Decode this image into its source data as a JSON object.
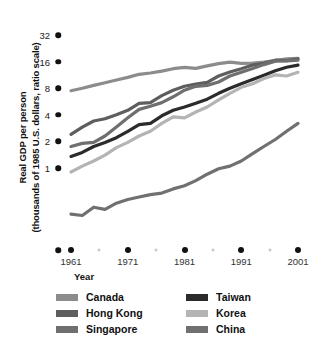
{
  "axes": {
    "ylabel_line1": "Real GDP per person",
    "ylabel_line2": "(thousands of 1985 U.S. dollars, ratio scale)",
    "xlabel": "Year",
    "ytick_labels": [
      "32",
      "16",
      "8",
      "4",
      "2",
      "1"
    ],
    "xtick_labels": [
      "1961",
      "1971",
      "1981",
      "1991",
      "2001"
    ]
  },
  "legend": {
    "left": [
      {
        "label": "Canada",
        "color": "#8c8c8c"
      },
      {
        "label": "Hong Kong",
        "color": "#5e5e5e"
      },
      {
        "label": "Singapore",
        "color": "#6f6f6f"
      }
    ],
    "right": [
      {
        "label": "Taiwan",
        "color": "#2b2b2b"
      },
      {
        "label": "Korea",
        "color": "#b4b4b4"
      },
      {
        "label": "China",
        "color": "#707070"
      }
    ]
  },
  "chart_data": {
    "type": "line",
    "title": "",
    "xlabel": "Year",
    "ylabel": "Real GDP per person (thousands of 1985 U.S. dollars, ratio scale)",
    "yscale": "log2",
    "ylim": [
      0.25,
      38
    ],
    "yticks": [
      1,
      2,
      4,
      8,
      16,
      32
    ],
    "xlim": [
      1960,
      2001
    ],
    "xticks": [
      1961,
      1971,
      1981,
      1991,
      2001
    ],
    "xminorticks": [
      1966,
      1976,
      1986,
      1996
    ],
    "grid": false,
    "legend_position": "below",
    "series": [
      {
        "name": "Canada",
        "color": "#8c8c8c",
        "x": [
          1961,
          1963,
          1965,
          1967,
          1969,
          1971,
          1973,
          1975,
          1977,
          1979,
          1981,
          1983,
          1985,
          1987,
          1989,
          1991,
          1993,
          1995,
          1997,
          1999,
          2001
        ],
        "values": [
          7.5,
          8.0,
          8.6,
          9.2,
          9.9,
          10.6,
          11.5,
          11.9,
          12.5,
          13.3,
          13.8,
          13.4,
          14.3,
          15.2,
          15.8,
          15.3,
          15.4,
          15.8,
          16.4,
          17.2,
          17.4
        ]
      },
      {
        "name": "Hong Kong",
        "color": "#5e5e5e",
        "x": [
          1961,
          1963,
          1965,
          1967,
          1969,
          1971,
          1973,
          1975,
          1977,
          1979,
          1981,
          1983,
          1985,
          1987,
          1989,
          1991,
          1993,
          1995,
          1997,
          1999,
          2001
        ],
        "values": [
          2.4,
          2.9,
          3.4,
          3.6,
          4.0,
          4.5,
          5.4,
          5.5,
          6.6,
          7.6,
          8.4,
          8.9,
          9.3,
          11.0,
          12.2,
          13.3,
          14.6,
          15.3,
          16.6,
          16.4,
          17.2
        ]
      },
      {
        "name": "Singapore",
        "color": "#6f6f6f",
        "x": [
          1961,
          1963,
          1965,
          1967,
          1969,
          1971,
          1973,
          1975,
          1977,
          1979,
          1981,
          1983,
          1985,
          1987,
          1989,
          1991,
          1993,
          1995,
          1997,
          1999,
          2001
        ],
        "values": [
          1.75,
          1.9,
          1.95,
          2.3,
          2.9,
          3.7,
          4.6,
          5.0,
          5.5,
          6.4,
          7.6,
          8.4,
          8.6,
          9.4,
          11.0,
          12.1,
          13.4,
          14.8,
          16.2,
          16.3,
          16.6
        ]
      },
      {
        "name": "Taiwan",
        "color": "#2b2b2b",
        "x": [
          1961,
          1963,
          1965,
          1967,
          1969,
          1971,
          1973,
          1975,
          1977,
          1979,
          1981,
          1983,
          1985,
          1987,
          1989,
          1991,
          1993,
          1995,
          1997,
          1999,
          2001
        ],
        "values": [
          1.35,
          1.5,
          1.75,
          1.95,
          2.2,
          2.6,
          3.1,
          3.2,
          3.9,
          4.5,
          4.9,
          5.4,
          6.0,
          7.0,
          8.0,
          9.0,
          10.0,
          11.2,
          12.6,
          13.8,
          14.6
        ]
      },
      {
        "name": "Korea",
        "color": "#b4b4b4",
        "x": [
          1961,
          1963,
          1965,
          1967,
          1969,
          1971,
          1973,
          1975,
          1977,
          1979,
          1981,
          1983,
          1985,
          1987,
          1989,
          1991,
          1993,
          1995,
          1997,
          1999,
          2001
        ],
        "values": [
          0.9,
          1.05,
          1.2,
          1.4,
          1.7,
          1.95,
          2.3,
          2.6,
          3.2,
          3.8,
          3.7,
          4.3,
          4.9,
          5.9,
          7.0,
          8.2,
          9.0,
          10.3,
          11.3,
          11.0,
          12.1
        ]
      },
      {
        "name": "China",
        "color": "#707070",
        "x": [
          1961,
          1963,
          1965,
          1967,
          1969,
          1971,
          1973,
          1975,
          1977,
          1979,
          1981,
          1983,
          1985,
          1987,
          1989,
          1991,
          1993,
          1995,
          1997,
          1999,
          2001
        ],
        "values": [
          0.3,
          0.29,
          0.36,
          0.34,
          0.4,
          0.44,
          0.47,
          0.5,
          0.52,
          0.58,
          0.63,
          0.72,
          0.85,
          0.98,
          1.05,
          1.2,
          1.45,
          1.75,
          2.1,
          2.6,
          3.2
        ]
      }
    ]
  }
}
